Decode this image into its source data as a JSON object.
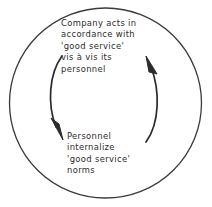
{
  "diagram": {
    "type": "cycle-diagram",
    "title": "",
    "stroke_color": "#2b2b2b",
    "text_color": "#2b2b2b",
    "background_color": "#ffffff",
    "outer_circle": {
      "name": "outer-boundary-circle",
      "center_x": 105,
      "center_y": 103,
      "radius": 96
    },
    "nodes": [
      {
        "id": "company",
        "lines": [
          "Company acts in",
          "accordance with",
          "'good service'",
          "vis à vis its",
          "personnel"
        ]
      },
      {
        "id": "personnel",
        "lines": [
          "Personnel",
          "internalize",
          "'good service'",
          "norms"
        ]
      }
    ],
    "arrows": [
      {
        "id": "arrow-left-down",
        "name": "arrow-company-to-personnel",
        "direction": "downward",
        "side": "left"
      },
      {
        "id": "arrow-right-up",
        "name": "arrow-personnel-to-company",
        "direction": "upward",
        "side": "right"
      }
    ]
  }
}
